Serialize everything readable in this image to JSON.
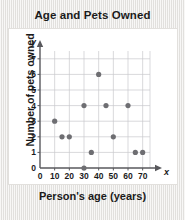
{
  "chart_data": {
    "type": "scatter",
    "title": "Age and Pets Owned",
    "xlabel": "Person's age (years)",
    "ylabel": "Number of pets owned",
    "x_axis_name": "x",
    "y_axis_name": "y",
    "xlim": [
      0,
      75
    ],
    "ylim": [
      0,
      7.5
    ],
    "xticks": [
      0,
      10,
      20,
      30,
      40,
      50,
      60,
      70
    ],
    "xtick_labels": [
      "0",
      "10",
      "20",
      "30",
      "40",
      "50",
      "60",
      "70"
    ],
    "yticks": [
      0,
      1,
      2,
      3,
      4,
      5,
      6,
      7
    ],
    "ytick_labels": [
      "0",
      "1",
      "2",
      "3",
      "4",
      "5",
      "6",
      "7"
    ],
    "grid": true,
    "legend": "none",
    "marker_color": "#6e6e72",
    "grid_color": "#c9c9cd",
    "axis_color": "#58585c",
    "points": [
      {
        "x": 10,
        "y": 3
      },
      {
        "x": 15,
        "y": 2
      },
      {
        "x": 20,
        "y": 2
      },
      {
        "x": 30,
        "y": 0
      },
      {
        "x": 30,
        "y": 4
      },
      {
        "x": 35,
        "y": 1
      },
      {
        "x": 40,
        "y": 6
      },
      {
        "x": 45,
        "y": 4
      },
      {
        "x": 50,
        "y": 2
      },
      {
        "x": 60,
        "y": 4
      },
      {
        "x": 65,
        "y": 1
      },
      {
        "x": 70,
        "y": 1
      }
    ]
  },
  "colors": {
    "background": "#efeeec",
    "plot_background": "#ffffff",
    "text": "#1b1b1b"
  }
}
